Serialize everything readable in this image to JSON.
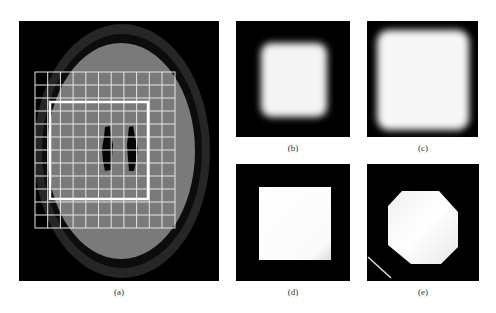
{
  "figure": {
    "panels": [
      {
        "id": "a",
        "caption": "(a)",
        "description": "Elliptical phantom with outer dark ring, inner gray region, two dark elongated lesions, overlaid grid and thick white rectangle"
      },
      {
        "id": "b",
        "caption": "(b)",
        "description": "Blurred white square on black background (smaller)"
      },
      {
        "id": "c",
        "caption": "(c)",
        "description": "Blurred white square on black background (larger)"
      },
      {
        "id": "d",
        "caption": "(d)",
        "description": "Sharp white square on black background"
      },
      {
        "id": "e",
        "caption": "(e)",
        "description": "White octagon on black background with diagonal white line at lower left"
      }
    ],
    "colors": {
      "background": "#000000",
      "outer_ring": "#262626",
      "inner_region": "#7a7a7a",
      "grid_lines": "#e6e6e6",
      "highlight": "#ffffff"
    }
  }
}
